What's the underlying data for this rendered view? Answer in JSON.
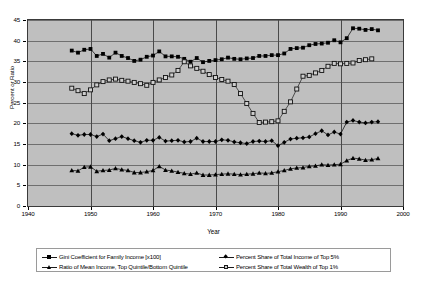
{
  "chart_data": {
    "type": "line",
    "title": "",
    "xlabel": "Year",
    "ylabel": "Percent or Ratio",
    "xlim": [
      1940,
      2000
    ],
    "ylim": [
      0,
      45
    ],
    "xticks": [
      1940,
      1950,
      1960,
      1970,
      1980,
      1990,
      2000
    ],
    "yticks": [
      0,
      5,
      10,
      15,
      20,
      25,
      30,
      35,
      40,
      45
    ],
    "grid": true,
    "legend_position": "bottom",
    "plot_background": "#bfbfbf",
    "series": [
      {
        "name": "Gini Coefficient for Family Income [x100]",
        "marker": "filled-square",
        "color": "#000000",
        "x": [
          1947,
          1948,
          1949,
          1950,
          1951,
          1952,
          1953,
          1954,
          1955,
          1956,
          1957,
          1958,
          1959,
          1960,
          1961,
          1962,
          1963,
          1964,
          1965,
          1966,
          1967,
          1968,
          1969,
          1970,
          1971,
          1972,
          1973,
          1974,
          1975,
          1976,
          1977,
          1978,
          1979,
          1980,
          1981,
          1982,
          1983,
          1984,
          1985,
          1986,
          1987,
          1988,
          1989,
          1990,
          1991,
          1992,
          1993,
          1994,
          1995,
          1996
        ],
        "values": [
          37.6,
          37.1,
          37.8,
          38.0,
          36.3,
          36.8,
          35.9,
          37.1,
          36.3,
          35.8,
          35.1,
          35.4,
          36.1,
          36.4,
          37.4,
          36.2,
          36.2,
          36.1,
          35.6,
          34.9,
          35.8,
          34.8,
          35.1,
          35.3,
          35.5,
          35.9,
          35.6,
          35.5,
          35.7,
          35.8,
          36.3,
          36.3,
          36.5,
          36.5,
          36.9,
          38.0,
          38.2,
          38.3,
          38.9,
          39.2,
          39.3,
          39.5,
          40.1,
          39.6,
          40.6,
          43.0,
          42.9,
          42.6,
          42.8,
          42.5
        ]
      },
      {
        "name": "Percent Share of Total Income of Top 5%",
        "marker": "filled-diamond",
        "color": "#000000",
        "x": [
          1947,
          1948,
          1949,
          1950,
          1951,
          1952,
          1953,
          1954,
          1955,
          1956,
          1957,
          1958,
          1959,
          1960,
          1961,
          1962,
          1963,
          1964,
          1965,
          1966,
          1967,
          1968,
          1969,
          1970,
          1971,
          1972,
          1973,
          1974,
          1975,
          1976,
          1977,
          1978,
          1979,
          1980,
          1981,
          1982,
          1983,
          1984,
          1985,
          1986,
          1987,
          1988,
          1989,
          1990,
          1991,
          1992,
          1993,
          1994,
          1995,
          1996
        ],
        "values": [
          17.5,
          17.1,
          17.3,
          17.3,
          16.8,
          17.4,
          15.8,
          16.3,
          16.8,
          16.3,
          15.8,
          15.4,
          15.9,
          15.9,
          16.6,
          15.7,
          15.8,
          15.9,
          15.5,
          15.6,
          16.4,
          15.6,
          15.6,
          15.6,
          16.0,
          15.9,
          15.5,
          15.3,
          15.1,
          15.6,
          15.7,
          15.6,
          15.8,
          14.6,
          15.4,
          16.2,
          16.4,
          16.5,
          16.7,
          17.5,
          18.2,
          17.2,
          17.9,
          17.4,
          20.3,
          20.7,
          20.3,
          20.1,
          20.3,
          20.4
        ]
      },
      {
        "name": "Ratio of Mean Income, Top Quintile/Bottom Quintile",
        "marker": "filled-triangle",
        "color": "#000000",
        "x": [
          1947,
          1948,
          1949,
          1950,
          1951,
          1952,
          1953,
          1954,
          1955,
          1956,
          1957,
          1958,
          1959,
          1960,
          1961,
          1962,
          1963,
          1964,
          1965,
          1966,
          1967,
          1968,
          1969,
          1970,
          1971,
          1972,
          1973,
          1974,
          1975,
          1976,
          1977,
          1978,
          1979,
          1980,
          1981,
          1982,
          1983,
          1984,
          1985,
          1986,
          1987,
          1988,
          1989,
          1990,
          1991,
          1992,
          1993,
          1994,
          1995,
          1996
        ],
        "values": [
          8.6,
          8.5,
          9.4,
          9.5,
          8.4,
          8.6,
          8.7,
          9.1,
          8.8,
          8.6,
          8.1,
          8.1,
          8.3,
          8.6,
          9.6,
          8.7,
          8.5,
          8.2,
          7.9,
          7.7,
          8.0,
          7.5,
          7.5,
          7.6,
          7.7,
          7.8,
          7.7,
          7.6,
          7.7,
          7.8,
          8.0,
          7.9,
          8.0,
          8.3,
          8.6,
          9.0,
          9.2,
          9.3,
          9.6,
          9.7,
          10.0,
          9.9,
          10.0,
          10.1,
          11.0,
          11.6,
          11.4,
          11.1,
          11.2,
          11.5
        ]
      },
      {
        "name": "Percent Share of Total Wealth of Top 1%",
        "marker": "open-square",
        "color": "#1a1a1a",
        "x": [
          1947,
          1948,
          1949,
          1950,
          1951,
          1952,
          1953,
          1954,
          1955,
          1956,
          1957,
          1958,
          1959,
          1960,
          1961,
          1962,
          1963,
          1964,
          1965,
          1966,
          1967,
          1968,
          1969,
          1970,
          1971,
          1972,
          1973,
          1974,
          1975,
          1976,
          1977,
          1978,
          1979,
          1980,
          1981,
          1982,
          1983,
          1984,
          1985,
          1986,
          1987,
          1988,
          1989,
          1990,
          1991,
          1992,
          1993,
          1994,
          1995
        ],
        "values": [
          28.5,
          27.9,
          27.2,
          28.1,
          29.3,
          30.1,
          30.5,
          30.7,
          30.4,
          30.2,
          29.9,
          29.6,
          29.2,
          29.9,
          30.5,
          31.1,
          31.7,
          32.8,
          34.9,
          33.9,
          33.3,
          32.6,
          31.8,
          31.1,
          30.6,
          30.2,
          29.4,
          27.2,
          24.8,
          22.4,
          20.2,
          20.3,
          20.4,
          20.6,
          22.9,
          25.2,
          28.3,
          31.4,
          31.6,
          32.2,
          32.8,
          33.8,
          34.5,
          34.4,
          34.5,
          34.6,
          35.2,
          35.4,
          35.6
        ]
      }
    ]
  },
  "axis": {
    "y_title": "Percent or Ratio",
    "x_title": "Year"
  },
  "legend": {
    "entries": [
      {
        "label": "Gini Coefficient for Family Income [x100]",
        "marker": "filled-square"
      },
      {
        "label": "Percent Share of Total Income of Top 5%",
        "marker": "filled-diamond"
      },
      {
        "label": "Ratio of Mean Income, Top Quintile/Bottom Quintile",
        "marker": "filled-triangle"
      },
      {
        "label": "Percent Share of Total Wealth of Top 1%",
        "marker": "open-square"
      }
    ]
  }
}
